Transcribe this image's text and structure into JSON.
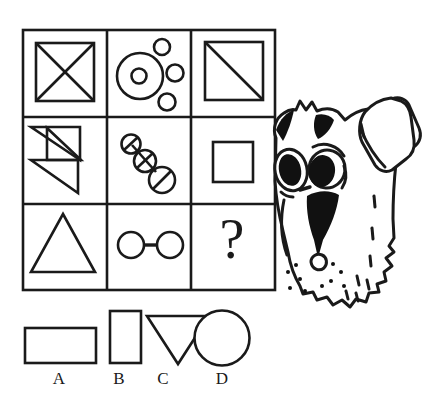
{
  "puzzle": {
    "type": "visual-analogy-matrix",
    "title_visible": false,
    "grid": {
      "rows": 3,
      "cols": 3,
      "cells": [
        {
          "id": "r1c1",
          "row": 1,
          "col": 1,
          "figure": "square-with-x-diagonals",
          "description": "Square outline crossed by both diagonals"
        },
        {
          "id": "r1c2",
          "row": 1,
          "col": 2,
          "figure": "large-circle-with-inner-circle-and-three-small-circles",
          "description": "Large circle containing a small circle, with three small circles outside to the right"
        },
        {
          "id": "r1c3",
          "row": 1,
          "col": 3,
          "figure": "square-with-one-diagonal",
          "description": "Square outline with a single diagonal from top-left to bottom-right"
        },
        {
          "id": "r2c1",
          "row": 2,
          "col": 1,
          "figure": "two-overlapping-triangles-pinwheel",
          "description": "Two triangles crossing to form a pinwheel/Z shape"
        },
        {
          "id": "r2c2",
          "row": 2,
          "col": 2,
          "figure": "three-slashed-circles-chain-diagonal",
          "description": "Three circles of increasing size in a diagonal chain, each struck through with a slash"
        },
        {
          "id": "r2c3",
          "row": 2,
          "col": 3,
          "figure": "plain-square",
          "description": "A plain small square outline"
        },
        {
          "id": "r3c1",
          "row": 3,
          "col": 1,
          "figure": "triangle-pointing-up",
          "description": "Upward-pointing triangle outline"
        },
        {
          "id": "r3c2",
          "row": 3,
          "col": 2,
          "figure": "two-circles-joined-by-bar",
          "description": "Two circles connected by a horizontal bar"
        },
        {
          "id": "r3c3",
          "row": 3,
          "col": 3,
          "figure": "question-mark",
          "missing": true,
          "text": "?",
          "description": "The missing element to be solved"
        }
      ]
    },
    "options": [
      {
        "key": "A",
        "label": "A",
        "figure": "horizontal-rectangle"
      },
      {
        "key": "B",
        "label": "B",
        "figure": "vertical-rectangle"
      },
      {
        "key": "C",
        "label": "C",
        "figure": "triangle-pointing-down"
      },
      {
        "key": "D",
        "label": "D",
        "figure": "circle"
      }
    ],
    "decoration": {
      "figure": "cartoon-dog-head",
      "description": "Line-art cartoon terrier dog head peeking from behind the right edge of the matrix, with one large floppy ear, black eye patches, black muzzle marking and whisker dots"
    },
    "colors": {
      "ink": "#1a1a1a",
      "background": "#ffffff",
      "fill": "#000000"
    }
  }
}
